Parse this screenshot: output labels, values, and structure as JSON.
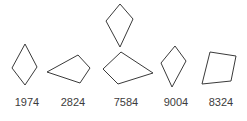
{
  "figure": {
    "title": "",
    "background_color": "#ffffff",
    "stroke_color": "#3a3a3a",
    "label_color": "#3c3c3c"
  },
  "chart_data": {
    "type": "diagram",
    "title": "",
    "xlabel": "",
    "ylabel": "",
    "items": [
      {
        "label": "1974",
        "shape": "kite",
        "polygons": [
          {
            "points": "25,44 12,68 25,85 37,67"
          }
        ]
      },
      {
        "label": "2824",
        "shape": "quadrilateral",
        "polygons": [
          {
            "points": "47,72 78,55 90,68 80,83"
          }
        ]
      },
      {
        "label": "7584",
        "shape": "kite-and-quadrilateral",
        "polygons": [
          {
            "points": "120,4 106,21 120,47 133,19"
          },
          {
            "points": "121,52 103,69 118,84 153,73"
          }
        ]
      },
      {
        "label": "9004",
        "shape": "kite",
        "polygons": [
          {
            "points": "175,46 161,63 172,87 186,61"
          }
        ]
      },
      {
        "label": "8324",
        "shape": "trapezoid",
        "polygons": [
          {
            "points": "210,52 236,56 231,81 202,84"
          }
        ]
      }
    ]
  }
}
